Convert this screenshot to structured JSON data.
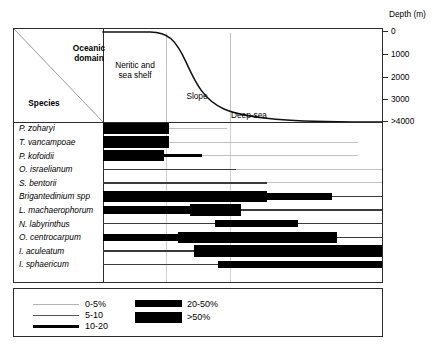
{
  "figure": {
    "axis_title": "Depth (m)",
    "corner_upper": "Oceanic\ndomain",
    "corner_upper_line1": "Oceanic",
    "corner_upper_line2": "domain",
    "corner_lower": "Species"
  },
  "depth_axis": {
    "title": "Depth (m)",
    "ticks": [
      "0",
      "1000",
      "2000",
      "3000",
      ">4000"
    ]
  },
  "zones": [
    {
      "name": "neritic",
      "label_line1": "Neritic and",
      "label_line2": "sea shelf"
    },
    {
      "name": "slope",
      "label_line1": "Slope",
      "label_line2": ""
    },
    {
      "name": "deepsea",
      "label_line1": "Deep-sea",
      "label_line2": ""
    }
  ],
  "legend": {
    "items": [
      {
        "label": "0-5%",
        "style": "hairline"
      },
      {
        "label": "5-10",
        "style": "thin"
      },
      {
        "label": "10-20",
        "style": "medium"
      },
      {
        "label": "20-50%",
        "style": "thick"
      },
      {
        "label": ">50%",
        "style": "verythick"
      }
    ]
  },
  "chart_data": {
    "type": "bar",
    "title": "",
    "xlabel": "Depth (m)",
    "ylabel": "Species",
    "x_axis": {
      "label": "Depth (m)",
      "ticks": [
        0,
        1000,
        2000,
        3000,
        4000
      ],
      "tick_labels": [
        "0",
        "1000",
        "2000",
        "3000",
        ">4000"
      ],
      "range": [
        0,
        4000
      ]
    },
    "zone_boundaries_m": [
      850,
      2400
    ],
    "zones": [
      "Neritic and sea shelf",
      "Slope",
      "Deep-sea"
    ],
    "abundance_classes": [
      "0-5%",
      "5-10",
      "10-20",
      "20-50%",
      ">50%"
    ],
    "categories": [
      "P. zoharyi",
      "T. vancampoae",
      "P. kofoidii",
      "O. israelianum",
      "S. bentorii",
      "Brigantedinium spp",
      "L. machaerophorum",
      "N. labyrinthus",
      "O. centrocarpum",
      "I. aculeatum",
      "I. sphaericum"
    ],
    "series": [
      {
        "name": "P. zoharyi",
        "segments": [
          {
            "start_m": 0,
            "end_m": 950,
            "class": ">50%"
          },
          {
            "start_m": 950,
            "end_m": 1780,
            "class": "0-5%"
          }
        ]
      },
      {
        "name": "T. vancampoae",
        "segments": [
          {
            "start_m": 0,
            "end_m": 950,
            "class": ">50%"
          },
          {
            "start_m": 950,
            "end_m": 3650,
            "class": "0-5%"
          }
        ]
      },
      {
        "name": "P. kofoidii",
        "segments": [
          {
            "start_m": 0,
            "end_m": 880,
            "class": ">50%"
          },
          {
            "start_m": 880,
            "end_m": 1420,
            "class": "10-20"
          },
          {
            "start_m": 1420,
            "end_m": 3650,
            "class": "0-5%"
          }
        ]
      },
      {
        "name": "O. israelianum",
        "segments": [
          {
            "start_m": 0,
            "end_m": 1900,
            "class": "5-10"
          },
          {
            "start_m": 1900,
            "end_m": 4000,
            "class": "0-5%"
          }
        ]
      },
      {
        "name": "S. bentorii",
        "segments": [
          {
            "start_m": 0,
            "end_m": 2350,
            "class": "5-10"
          },
          {
            "start_m": 2350,
            "end_m": 4000,
            "class": "0-5%"
          }
        ]
      },
      {
        "name": "Brigantedinium spp",
        "segments": [
          {
            "start_m": 0,
            "end_m": 2350,
            "class": ">50%"
          },
          {
            "start_m": 2350,
            "end_m": 3280,
            "class": "20-50%"
          },
          {
            "start_m": 3280,
            "end_m": 4000,
            "class": "5-10"
          }
        ]
      },
      {
        "name": "L. machaerophorum",
        "segments": [
          {
            "start_m": 0,
            "end_m": 1250,
            "class": "20-50%"
          },
          {
            "start_m": 1250,
            "end_m": 1980,
            "class": ">50%"
          },
          {
            "start_m": 1980,
            "end_m": 4000,
            "class": "5-10"
          }
        ]
      },
      {
        "name": "N. labyrinthus",
        "segments": [
          {
            "start_m": 0,
            "end_m": 1600,
            "class": "5-10"
          },
          {
            "start_m": 1600,
            "end_m": 2800,
            "class": "20-50%"
          },
          {
            "start_m": 2800,
            "end_m": 4000,
            "class": "5-10"
          }
        ]
      },
      {
        "name": "O. centrocarpum",
        "segments": [
          {
            "start_m": 0,
            "end_m": 1080,
            "class": "20-50%"
          },
          {
            "start_m": 1080,
            "end_m": 3350,
            "class": ">50%"
          },
          {
            "start_m": 3350,
            "end_m": 4000,
            "class": "5-10"
          }
        ]
      },
      {
        "name": "I. aculeatum",
        "segments": [
          {
            "start_m": 0,
            "end_m": 1300,
            "class": "5-10"
          },
          {
            "start_m": 1300,
            "end_m": 4000,
            "class": ">50%"
          }
        ]
      },
      {
        "name": "I. sphaericum",
        "segments": [
          {
            "start_m": 0,
            "end_m": 1650,
            "class": "5-10"
          },
          {
            "start_m": 1650,
            "end_m": 4000,
            "class": "20-50%"
          }
        ]
      }
    ]
  }
}
